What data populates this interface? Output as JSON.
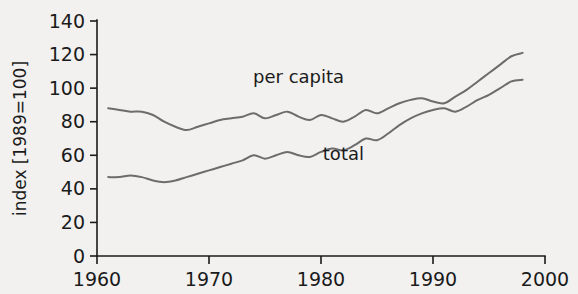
{
  "chart_data": {
    "type": "line",
    "title": "",
    "xlabel": "",
    "ylabel": "index [1989=100]",
    "xlim": [
      1960,
      2000
    ],
    "ylim": [
      0,
      140
    ],
    "xticks": [
      1960,
      1970,
      1980,
      1990,
      2000
    ],
    "yticks": [
      0,
      20,
      40,
      60,
      80,
      100,
      120,
      140
    ],
    "grid": false,
    "legend_position": "inline-annotations",
    "line_color": "#6c6c6c",
    "axis_color": "#1b1b1b",
    "background_color": "#f2f1ef",
    "x": [
      1961,
      1962,
      1963,
      1964,
      1965,
      1966,
      1967,
      1968,
      1969,
      1970,
      1971,
      1972,
      1973,
      1974,
      1975,
      1976,
      1977,
      1978,
      1979,
      1980,
      1981,
      1982,
      1983,
      1984,
      1985,
      1986,
      1987,
      1988,
      1989,
      1990,
      1991,
      1992,
      1993,
      1994,
      1995,
      1996,
      1997,
      1998
    ],
    "series": [
      {
        "name": "per capita",
        "label": "per capita",
        "values": [
          88,
          87,
          86,
          86,
          84,
          80,
          77,
          75,
          77,
          79,
          81,
          82,
          83,
          85,
          82,
          84,
          86,
          83,
          81,
          84,
          82,
          80,
          83,
          87,
          85,
          88,
          91,
          93,
          94,
          92,
          91,
          95,
          99,
          104,
          109,
          114,
          119,
          121
        ]
      },
      {
        "name": "total",
        "label": "total",
        "values": [
          47,
          47,
          48,
          47,
          45,
          44,
          45,
          47,
          49,
          51,
          53,
          55,
          57,
          60,
          58,
          60,
          62,
          60,
          59,
          62,
          64,
          63,
          66,
          70,
          69,
          73,
          78,
          82,
          85,
          87,
          88,
          86,
          89,
          93,
          96,
          100,
          104,
          105
        ]
      }
    ],
    "annotations": [
      {
        "text": "per capita",
        "x": 1978,
        "y": 103
      },
      {
        "text": "total",
        "x": 1982,
        "y": 57
      }
    ]
  }
}
